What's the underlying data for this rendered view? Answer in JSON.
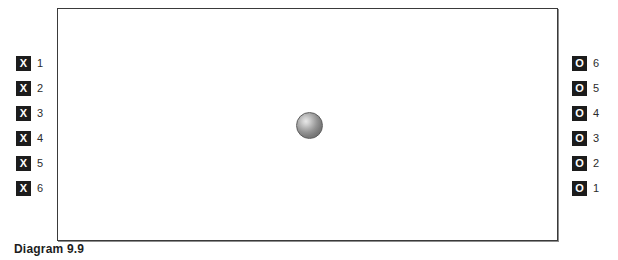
{
  "caption": "Diagram 9.9",
  "court": {
    "label": "playing-area",
    "background_color": "#ffffff",
    "border_color": "#3a3a3a"
  },
  "ball": {
    "label": "ball",
    "color": "#8e8e8e",
    "highlight_color": "#e8e8e8"
  },
  "badge_colors": {
    "background": "#1c1c1c",
    "text": "#ffffff"
  },
  "left_column": {
    "name": "x-players",
    "symbol": "X",
    "items": [
      {
        "symbol": "X",
        "number": "1"
      },
      {
        "symbol": "X",
        "number": "2"
      },
      {
        "symbol": "X",
        "number": "3"
      },
      {
        "symbol": "X",
        "number": "4"
      },
      {
        "symbol": "X",
        "number": "5"
      },
      {
        "symbol": "X",
        "number": "6"
      }
    ]
  },
  "right_column": {
    "name": "o-players",
    "symbol": "O",
    "items": [
      {
        "symbol": "O",
        "number": "6"
      },
      {
        "symbol": "O",
        "number": "5"
      },
      {
        "symbol": "O",
        "number": "4"
      },
      {
        "symbol": "O",
        "number": "3"
      },
      {
        "symbol": "O",
        "number": "2"
      },
      {
        "symbol": "O",
        "number": "1"
      }
    ]
  }
}
